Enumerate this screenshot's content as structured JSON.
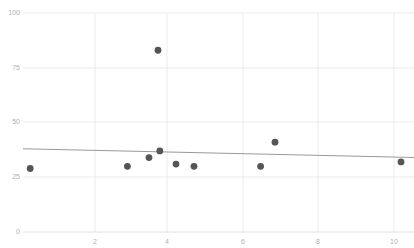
{
  "chart_data": {
    "type": "scatter",
    "title": "",
    "subtitle": "",
    "xlabel": "",
    "ylabel": "",
    "xlim": [
      0,
      10.9
    ],
    "ylim": [
      0,
      100
    ],
    "grid": true,
    "legend": null,
    "x_ticks": [
      2,
      4,
      6,
      8,
      10
    ],
    "x_tick_labels": [
      "2",
      "4",
      "6",
      "8",
      "10"
    ],
    "y_ticks": [
      0,
      25,
      50,
      75,
      100
    ],
    "y_tick_labels": [
      "0",
      "25",
      "50",
      "75",
      "100"
    ],
    "point_color": "#555555",
    "gridline_color": "#e4e4e4",
    "trendline_color": "#9a9a9a",
    "tick_label_color": "#b0b0b0",
    "background_color": "#ffffff",
    "points": [
      {
        "x": 0.2,
        "y": 29
      },
      {
        "x": 2.9,
        "y": 30
      },
      {
        "x": 3.5,
        "y": 34
      },
      {
        "x": 3.75,
        "y": 83
      },
      {
        "x": 3.8,
        "y": 37
      },
      {
        "x": 4.25,
        "y": 31
      },
      {
        "x": 4.75,
        "y": 30
      },
      {
        "x": 6.6,
        "y": 30
      },
      {
        "x": 7.0,
        "y": 41
      },
      {
        "x": 10.5,
        "y": 32
      }
    ],
    "series": [
      {
        "name": "observations",
        "type": "scatter",
        "x": [
          0.2,
          2.9,
          3.5,
          3.75,
          3.8,
          4.25,
          4.75,
          6.6,
          7.0,
          10.5
        ],
        "values": [
          29,
          30,
          34,
          83,
          37,
          31,
          30,
          30,
          41,
          32
        ]
      },
      {
        "name": "trendline",
        "type": "line",
        "x": [
          0,
          10.9
        ],
        "values": [
          38,
          34
        ]
      }
    ]
  }
}
